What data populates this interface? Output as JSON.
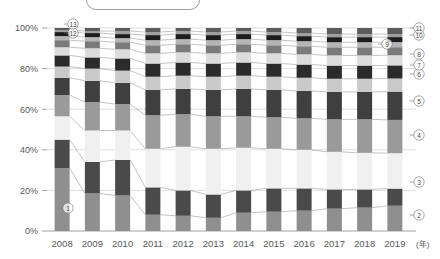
{
  "title_box": {
    "label": ""
  },
  "axes": {
    "y_unit": "%",
    "y_ticks": [
      "0%",
      "20%",
      "40%",
      "60%",
      "80%",
      "100%"
    ],
    "y_tick_values": [
      0,
      20,
      40,
      60,
      80,
      100
    ],
    "x_unit_label": "(年)",
    "x_ticks": [
      "2008",
      "2009",
      "2010",
      "2011",
      "2012",
      "2013",
      "2014",
      "2015",
      "2016",
      "2017",
      "2018",
      "2019"
    ]
  },
  "series_markers": [
    {
      "id": "1",
      "glyph": "①",
      "x": 68,
      "y": 208
    },
    {
      "id": "2",
      "glyph": "②",
      "x": 419,
      "y": 215
    },
    {
      "id": "3",
      "glyph": "③",
      "x": 419,
      "y": 182
    },
    {
      "id": "4",
      "glyph": "④",
      "x": 419,
      "y": 135
    },
    {
      "id": "5",
      "glyph": "⑤",
      "x": 419,
      "y": 101
    },
    {
      "id": "6",
      "glyph": "⑥",
      "x": 419,
      "y": 74
    },
    {
      "id": "7",
      "glyph": "⑦",
      "x": 419,
      "y": 65
    },
    {
      "id": "8",
      "glyph": "⑧",
      "x": 419,
      "y": 54
    },
    {
      "id": "9",
      "glyph": "⑨",
      "x": 387,
      "y": 44
    },
    {
      "id": "10",
      "glyph": "⑩",
      "x": 419,
      "y": 35
    },
    {
      "id": "11",
      "glyph": "⑪",
      "x": 419,
      "y": 28
    },
    {
      "id": "12",
      "glyph": "⑫",
      "x": 73,
      "y": 33
    },
    {
      "id": "13",
      "glyph": "⑬",
      "x": 73,
      "y": 24
    }
  ],
  "chart_data": {
    "type": "bar",
    "stacked": true,
    "normalized_percent": true,
    "title": "",
    "xlabel": "(年)",
    "ylabel": "",
    "ylim": [
      0,
      100
    ],
    "grid": true,
    "legend_position": "inline-callouts",
    "categories": [
      "2008",
      "2009",
      "2010",
      "2011",
      "2012",
      "2013",
      "2014",
      "2015",
      "2016",
      "2017",
      "2018",
      "2019"
    ],
    "series": [
      {
        "name": "①",
        "color": "#8f8f8f",
        "values": [
          31.0,
          18.5,
          17.5,
          8.0,
          7.5,
          6.5,
          9.0,
          9.5,
          10.0,
          11.0,
          11.5,
          12.5
        ]
      },
      {
        "name": "②",
        "color": "#4a4a4a",
        "values": [
          14.0,
          15.5,
          17.5,
          13.5,
          12.5,
          11.5,
          11.0,
          11.5,
          11.0,
          9.5,
          9.0,
          8.5
        ]
      },
      {
        "name": "③",
        "color": "#f0f0f0",
        "values": [
          11.5,
          15.5,
          14.5,
          19.0,
          21.5,
          22.5,
          21.0,
          19.5,
          19.0,
          18.5,
          18.0,
          17.5
        ]
      },
      {
        "name": "④",
        "color": "#9a9a9a",
        "values": [
          10.5,
          14.0,
          13.0,
          16.5,
          16.0,
          16.0,
          15.5,
          15.5,
          15.5,
          16.0,
          16.5,
          16.5
        ]
      },
      {
        "name": "⑤",
        "color": "#3f3f3f",
        "values": [
          8.5,
          10.5,
          10.5,
          12.5,
          12.5,
          13.0,
          13.5,
          13.5,
          13.5,
          13.5,
          13.5,
          14.0
        ]
      },
      {
        "name": "⑥",
        "color": "#c9c9c9",
        "values": [
          5.5,
          6.0,
          6.0,
          6.5,
          6.5,
          6.5,
          6.5,
          6.5,
          6.5,
          6.5,
          6.5,
          6.5
        ]
      },
      {
        "name": "⑦",
        "color": "#2b2b2b",
        "values": [
          5.5,
          5.5,
          6.0,
          6.5,
          6.5,
          6.5,
          6.5,
          6.5,
          6.5,
          6.5,
          6.5,
          6.5
        ]
      },
      {
        "name": "⑧",
        "color": "#dcdcdc",
        "values": [
          4.0,
          4.5,
          4.5,
          5.0,
          5.0,
          5.0,
          5.0,
          5.0,
          5.0,
          5.0,
          5.0,
          5.0
        ]
      },
      {
        "name": "⑨",
        "color": "#7b7b7b",
        "values": [
          3.5,
          3.5,
          3.5,
          4.0,
          4.0,
          4.0,
          4.0,
          4.0,
          4.0,
          4.0,
          4.0,
          4.0
        ]
      },
      {
        "name": "⑩",
        "color": "#b5b5b5",
        "values": [
          2.0,
          2.0,
          2.0,
          2.5,
          2.5,
          2.5,
          2.5,
          2.5,
          2.5,
          2.5,
          2.5,
          2.5
        ]
      },
      {
        "name": "⑪",
        "color": "#1c1c1c",
        "values": [
          2.0,
          2.0,
          2.0,
          2.5,
          2.5,
          2.5,
          2.5,
          2.5,
          2.5,
          2.5,
          2.5,
          2.5
        ]
      },
      {
        "name": "⑫",
        "color": "#9f9f9f",
        "values": [
          1.0,
          1.0,
          1.5,
          1.5,
          1.5,
          1.5,
          1.5,
          1.5,
          1.5,
          1.5,
          1.5,
          1.5
        ]
      },
      {
        "name": "⑬",
        "color": "#5c5c5c",
        "values": [
          1.0,
          1.5,
          1.5,
          2.0,
          1.5,
          2.0,
          1.5,
          2.0,
          2.5,
          3.0,
          3.0,
          3.0
        ]
      }
    ]
  },
  "geometry": {
    "plot_left": 47,
    "plot_right": 410,
    "plot_top": 28,
    "plot_bottom": 231,
    "bar_width": 15
  }
}
